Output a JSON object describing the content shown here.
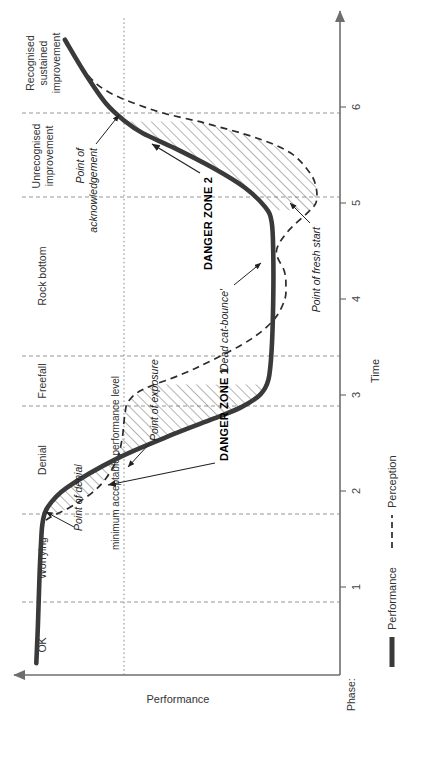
{
  "chart_data": {
    "type": "line",
    "title": "",
    "xlabel": "Time",
    "ylabel": "Performance",
    "xlim": [
      0,
      6.6
    ],
    "ylim": [
      0,
      1.0
    ],
    "grid": true,
    "xticks": [
      "1",
      "2",
      "3",
      "4",
      "5",
      "6"
    ],
    "xtick_values": [
      1,
      2,
      3,
      4,
      5,
      6
    ],
    "legend_position": "top-left",
    "series": [
      {
        "name": "Performance",
        "style": "solid-thick",
        "color": "#3a3a3a",
        "x": [
          0.12,
          0.5,
          1.0,
          1.35,
          1.55,
          1.7,
          1.9,
          2.2,
          2.45,
          2.6,
          2.72,
          2.85,
          3.0,
          3.3,
          3.8,
          4.3,
          4.6,
          4.75,
          4.95,
          5.15,
          5.35,
          5.5,
          5.62,
          5.8,
          6.1,
          6.45
        ],
        "y": [
          0.955,
          0.95,
          0.945,
          0.94,
          0.935,
          0.92,
          0.86,
          0.7,
          0.52,
          0.4,
          0.31,
          0.25,
          0.225,
          0.215,
          0.21,
          0.21,
          0.215,
          0.235,
          0.3,
          0.4,
          0.52,
          0.62,
          0.675,
          0.735,
          0.8,
          0.865
        ]
      },
      {
        "name": "Perception",
        "style": "dashed",
        "color": "#2b2b2b",
        "x": [
          0.12,
          0.6,
          1.1,
          1.4,
          1.55,
          1.62,
          1.7,
          1.85,
          2.0,
          2.2,
          2.4,
          2.55,
          2.68,
          2.78,
          2.9,
          3.05,
          3.2,
          3.4,
          3.6,
          3.8,
          3.95,
          4.1,
          4.3,
          4.5,
          4.7,
          4.8,
          4.95,
          5.1,
          5.3,
          5.45,
          5.6,
          5.75,
          6.0,
          6.45
        ],
        "y": [
          0.955,
          0.95,
          0.945,
          0.94,
          0.93,
          0.9,
          0.85,
          0.78,
          0.735,
          0.7,
          0.685,
          0.68,
          0.675,
          0.665,
          0.62,
          0.5,
          0.4,
          0.285,
          0.21,
          0.175,
          0.17,
          0.175,
          0.2,
          0.165,
          0.1,
          0.075,
          0.075,
          0.095,
          0.155,
          0.26,
          0.42,
          0.6,
          0.765,
          0.865
        ]
      }
    ],
    "minimum_acceptable_performance_level": 0.66,
    "min_level_label": "minimum acceptable performance level",
    "phase_axis_label": "Phase:",
    "phases": [
      {
        "label": "OK",
        "start": 0.0,
        "end": 0.72
      },
      {
        "label": "Worrying",
        "start": 0.72,
        "end": 1.62
      },
      {
        "label": "Denial",
        "start": 1.62,
        "end": 2.72
      },
      {
        "label": "Freefall",
        "start": 2.72,
        "end": 3.13
      },
      {
        "label": "Rock bottom",
        "start": 3.13,
        "end": 4.72
      },
      {
        "label": "Unrecognised\nimprovement",
        "start": 4.72,
        "end": 5.55
      },
      {
        "label": "Recognised\nsustained\nimprovement",
        "start": 5.55,
        "end": 6.6
      }
    ],
    "phase_labels_flat": [
      "OK",
      "Worrying",
      "Denial",
      "Freefall",
      "Rock bottom",
      "Unrecognised improvement",
      "Recognised sustained improvement"
    ],
    "shaded_regions": [
      {
        "name": "DANGER ZONE 1",
        "hatch": true,
        "from_x": 1.62,
        "to_x": 2.95
      },
      {
        "name": "DANGER ZONE 2",
        "hatch": true,
        "from_x": 4.72,
        "to_x": 5.62
      }
    ],
    "annotations": [
      {
        "label": "Point of denial",
        "point_x": 1.62,
        "point_y": 0.93
      },
      {
        "label": "Point of exposure",
        "point_x": 2.78,
        "point_y": 0.665
      },
      {
        "label": "'Dead cat-bounce'",
        "point_x": 4.3,
        "point_y": 0.2
      },
      {
        "label": "Point of fresh start",
        "point_x": 4.82,
        "point_y": 0.075
      },
      {
        "label": "Point of acknowledgement",
        "point_x": 5.6,
        "point_y": 0.675
      },
      {
        "label": "DANGER ZONE 1",
        "point_x": 2.25,
        "point_y": 0.6
      },
      {
        "label": "DANGER ZONE 2",
        "point_x": 5.17,
        "point_y": 0.4
      }
    ]
  },
  "legend": {
    "items": [
      {
        "label": "Performance",
        "style": "solid"
      },
      {
        "label": "Perception",
        "style": "dashed"
      }
    ]
  },
  "axes": {
    "x_title": "Time",
    "y_title": "Performance",
    "phase_row_title": "Phase:"
  },
  "ticks": {
    "x": [
      "1",
      "2",
      "3",
      "4",
      "5",
      "6"
    ]
  },
  "labels": {
    "min_level": "minimum acceptable performance level",
    "point_of_denial": "Point of denial",
    "point_of_exposure": "Point of exposure",
    "dead_cat_bounce": "'Dead cat-bounce'",
    "point_of_fresh_start": "Point of fresh start",
    "point_of_acknowledgement_l1": "Point of",
    "point_of_acknowledgement_l2": "acknowledgement",
    "danger_zone_1": "DANGER ZONE 1",
    "danger_zone_2": "DANGER ZONE 2",
    "phase_ok": "OK",
    "phase_worrying": "Worrying",
    "phase_denial": "Denial",
    "phase_freefall": "Freefall",
    "phase_rock_bottom": "Rock bottom",
    "phase_unrecognised_l1": "Unrecognised",
    "phase_unrecognised_l2": "improvement",
    "phase_recognised_l1": "Recognised",
    "phase_recognised_l2": "sustained",
    "phase_recognised_l3": "improvement"
  },
  "colors": {
    "performance_line": "#3a3a3a",
    "perception_line": "#2b2b2b",
    "grid": "#8a8a8a",
    "axis": "#6e6e6e",
    "text": "#333333",
    "hatch": "#5a5a5a"
  }
}
